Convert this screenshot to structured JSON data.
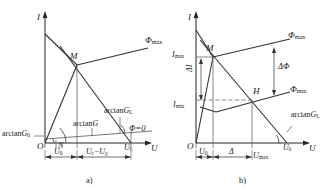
{
  "figure": {
    "type": "technical-line-diagram",
    "panels": [
      {
        "id": "a",
        "caption": "a)",
        "axes": {
          "y_label": "I",
          "x_label": "U",
          "origin_label": "O"
        },
        "points": [
          {
            "name": "M",
            "label": "M"
          },
          {
            "name": "N",
            "label": "N"
          }
        ],
        "curve_labels": [
          {
            "name": "phi-max",
            "text": "Φ",
            "sub": "max"
          },
          {
            "name": "phi-zero",
            "text": "Φ=0",
            "sub": ""
          }
        ],
        "angle_labels": [
          {
            "name": "arctan-g0",
            "text": "arctan",
            "sym": "G",
            "sub": "0"
          },
          {
            "name": "arctan-g",
            "text": "arctan",
            "sym": "G",
            "sub": ""
          },
          {
            "name": "arctan-gl",
            "text": "arctan",
            "sym": "G",
            "sub": "L"
          }
        ],
        "axis_ticks": [
          {
            "name": "ub-tick",
            "sym": "U",
            "sub": "b"
          }
        ],
        "dimensions": [
          {
            "name": "dim-u0",
            "sym": "U",
            "sub": "0",
            "text": ""
          },
          {
            "name": "dim-ub-minus-u0",
            "text": "Uₑ−U₀"
          }
        ]
      },
      {
        "id": "b",
        "caption": "b)",
        "axes": {
          "y_label": "I",
          "x_label": "U",
          "origin_label": "O"
        },
        "points": [
          {
            "name": "M",
            "label": "M"
          },
          {
            "name": "H",
            "label": "H"
          }
        ],
        "curve_labels": [
          {
            "name": "phi-max",
            "text": "Φ",
            "sub": "max"
          },
          {
            "name": "phi-min",
            "text": "Φ",
            "sub": "min"
          }
        ],
        "angle_labels": [
          {
            "name": "arctan-gl",
            "text": "arctan",
            "sym": "G",
            "sub": "L"
          }
        ],
        "axis_ticks": [
          {
            "name": "imax-tick",
            "sym": "I",
            "sub": "max"
          },
          {
            "name": "imin-tick",
            "sym": "I",
            "sub": "min"
          },
          {
            "name": "ub-tick",
            "sym": "U",
            "sub": "b"
          },
          {
            "name": "umax-tick",
            "sym": "U",
            "sub": "max"
          }
        ],
        "dimensions": [
          {
            "name": "dim-delta-i",
            "text": "ΔI"
          },
          {
            "name": "dim-delta-phi",
            "text": "ΔΦ"
          },
          {
            "name": "dim-u0",
            "sym": "U",
            "sub": "0"
          },
          {
            "name": "dim-delta",
            "text": "Δ"
          }
        ]
      }
    ],
    "colors": {
      "line": "#222222",
      "thin": "#555555",
      "text": "#1a1a1a"
    }
  }
}
